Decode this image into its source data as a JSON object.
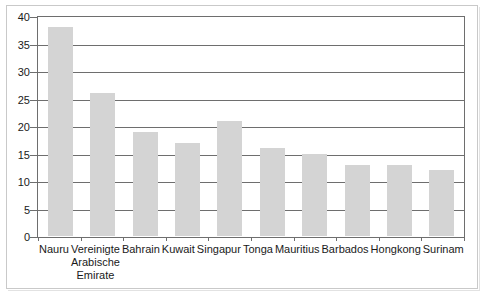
{
  "chart_data": {
    "type": "bar",
    "title": "",
    "subtitle": "",
    "xlabel": "",
    "ylabel": "",
    "categories": [
      "Nauru",
      "Vereinigte Arabische Emirate",
      "Bahrain",
      "Kuwait",
      "Singapur",
      "Tonga",
      "Mauritius",
      "Barbados",
      "Hongkong",
      "Surinam"
    ],
    "category_label_lines": [
      [
        "Nauru"
      ],
      [
        "Vereinigte",
        "Arabische",
        "Emirate"
      ],
      [
        "Bahrain"
      ],
      [
        "Kuwait"
      ],
      [
        "Singapur"
      ],
      [
        "Tonga"
      ],
      [
        "Mauritius"
      ],
      [
        "Barbados"
      ],
      [
        "Hongkong"
      ],
      [
        "Surinam"
      ]
    ],
    "values": [
      38,
      26,
      19,
      17,
      21,
      16,
      15,
      13,
      13,
      12
    ],
    "ylim": [
      0,
      40
    ],
    "ytick_values": [
      0,
      5,
      10,
      15,
      20,
      25,
      30,
      35,
      40
    ],
    "ytick_labels": [
      "0",
      "5",
      "10",
      "15",
      "20",
      "25",
      "30",
      "35",
      "40"
    ],
    "grid": true,
    "grid_axis": "y",
    "legend": false,
    "legend_position": "none",
    "bar_color": "#d4d4d4",
    "grid_color": "#6e6e6e",
    "axis_color": "#6e6e6e",
    "text_color": "#1a1a1a",
    "background_color": "#ffffff"
  }
}
